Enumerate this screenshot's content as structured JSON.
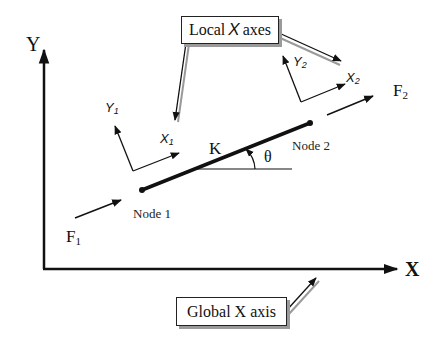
{
  "diagram": {
    "global_axes": {
      "y_label": "Y",
      "x_label": "X"
    },
    "element": {
      "stiffness_label": "K",
      "angle_label": "θ",
      "node1_label": "Node 1",
      "node2_label": "Node 2"
    },
    "forces": {
      "f1": {
        "base": "F",
        "sub": "1"
      },
      "f2": {
        "base": "F",
        "sub": "2"
      }
    },
    "local_axes": {
      "node1": {
        "y": {
          "base": "Y",
          "sub": "1"
        },
        "x": {
          "base": "X",
          "sub": "1"
        }
      },
      "node2": {
        "y": {
          "base": "Y",
          "sub": "2"
        },
        "x": {
          "base": "X",
          "sub": "2"
        }
      }
    },
    "callouts": {
      "local": {
        "prefix": "Local",
        "axis": "X",
        "suffix": "axes"
      },
      "global": {
        "text": "Global X axis"
      }
    },
    "colors": {
      "line": "#111111",
      "shadow": "#9a9a9a",
      "background": "#ffffff"
    }
  }
}
